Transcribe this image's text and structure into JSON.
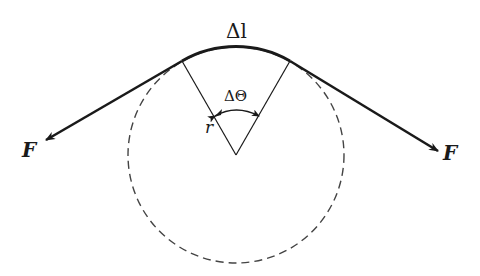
{
  "diagram": {
    "title": "",
    "labels": {
      "arc_length": "Δl",
      "angle": "ΔΘ",
      "radius": "r",
      "force_left": "F",
      "force_right": "F"
    },
    "colors": {
      "stroke": "#1a1a1a",
      "dashed_circle": "#444444",
      "background": "#ffffff"
    }
  }
}
